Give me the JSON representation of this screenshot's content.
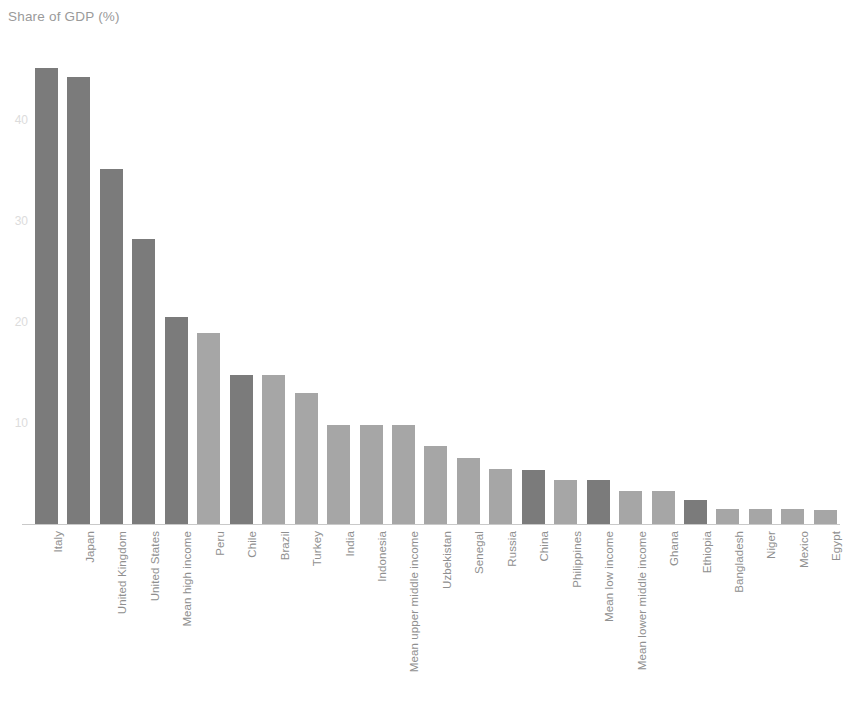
{
  "chart_data": {
    "type": "bar",
    "title": "Share of GDP (%)",
    "subtitle": "",
    "xlabel": "",
    "ylabel": "Share of GDP (%)",
    "ylim": [
      0,
      47
    ],
    "grid": false,
    "legend": null,
    "y_ticks": [
      10,
      20,
      30,
      40
    ],
    "y_tick_labels": [
      "10",
      "20",
      "30",
      "40"
    ],
    "categories": [
      "Italy",
      "Japan",
      "United Kingdom",
      "United States",
      "Mean high income",
      "Peru",
      "Chile",
      "Brazil",
      "Turkey",
      "India",
      "Indonesia",
      "Mean upper middle income",
      "Uzbekistan",
      "Senegal",
      "Russia",
      "China",
      "Philippines",
      "Mean low income",
      "Mean lower middle income",
      "Ghana",
      "Ethiopia",
      "Bangladesh",
      "Niger",
      "Mexico",
      "Egypt"
    ],
    "values": [
      45.2,
      44.3,
      35.2,
      28.2,
      20.5,
      18.9,
      14.8,
      14.8,
      13.0,
      9.8,
      9.8,
      9.8,
      7.7,
      6.5,
      5.5,
      5.4,
      4.4,
      4.4,
      3.3,
      3.3,
      2.4,
      1.5,
      1.5,
      1.5,
      1.4
    ],
    "bar_shades": [
      "dark",
      "dark",
      "dark",
      "dark",
      "dark",
      "light",
      "dark",
      "light",
      "light",
      "light",
      "light",
      "light",
      "light",
      "light",
      "light",
      "dark",
      "light",
      "dark",
      "light",
      "light",
      "dark",
      "light",
      "light",
      "light",
      "light"
    ]
  },
  "colors": {
    "bar_dark": "#7b7b7b",
    "bar_light": "#a6a6a6",
    "axis": "#c9c9c9",
    "title_text": "#9a9a9a",
    "tick_text": "#8f8f8f",
    "y_tick_text": "#dcdcdc",
    "background": "#ffffff"
  },
  "geometry": {
    "baseline_y": 524,
    "units_per_pixel_y": 0.0991,
    "first_bar_left": 35,
    "bar_width": 23,
    "bar_pitch": 32.45
  }
}
